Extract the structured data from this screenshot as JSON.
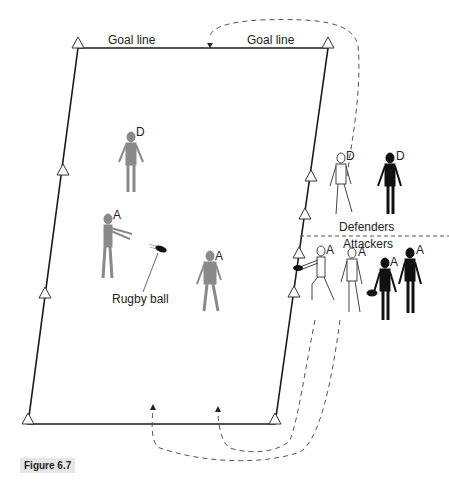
{
  "labels": {
    "goal_line_left": "Goal line",
    "goal_line_right": "Goal line",
    "defenders": "Defenders",
    "attackers": "Attackers",
    "rugby_ball": "Rugby ball",
    "figure_caption": "Figure 6.7"
  },
  "players": [
    {
      "role_label": "D",
      "team": "defender",
      "style": "grey",
      "location": "field"
    },
    {
      "role_label": "A",
      "team": "attacker",
      "style": "grey",
      "location": "field-passing"
    },
    {
      "role_label": "A",
      "team": "attacker",
      "style": "grey",
      "location": "field"
    },
    {
      "role_label": "D",
      "team": "defender",
      "style": "outline",
      "location": "sideline"
    },
    {
      "role_label": "D",
      "team": "defender",
      "style": "black",
      "location": "sideline"
    },
    {
      "role_label": "A",
      "team": "attacker",
      "style": "outline",
      "location": "sideline-passing"
    },
    {
      "role_label": "A",
      "team": "attacker",
      "style": "outline",
      "location": "sideline"
    },
    {
      "role_label": "A",
      "team": "attacker",
      "style": "black",
      "location": "sideline-with-ball"
    },
    {
      "role_label": "A",
      "team": "attacker",
      "style": "black",
      "location": "sideline"
    }
  ],
  "colors": {
    "line": "#1a1a1a",
    "grey_player": "#8a8a8a",
    "black_player": "#111111",
    "dashed": "#555555",
    "caption_bg": "#e6e6e6"
  }
}
